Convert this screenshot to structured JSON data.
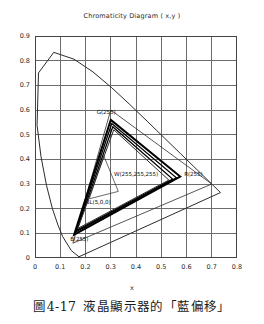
{
  "chart_title": "Chromaticity Diagram ( x,y )",
  "axes": {
    "xlabel": "x",
    "ylabel": "",
    "xlim": [
      0,
      0.8
    ],
    "ylim": [
      0,
      0.9
    ],
    "xticks": [
      "0",
      "0.1",
      "0.2",
      "0.3",
      "0.4",
      "0.5",
      "0.6",
      "0.7",
      "0.8"
    ],
    "yticks": [
      "0",
      "0.1",
      "0.2",
      "0.3",
      "0.4",
      "0.5",
      "0.6",
      "0.7",
      "0.8",
      "0.9"
    ],
    "grid": true
  },
  "caption": {
    "figure_number": "圖4-17",
    "text": "液晶顯示器的「藍偏移」"
  },
  "point_labels": {
    "green": "G(255)",
    "white": "W(255,255,255)",
    "black": "BL(5,0,0)",
    "red": "R(255)",
    "blue": "B(255)"
  },
  "colors": {
    "axis": "#444444",
    "grid": "#6b6b6b",
    "locus": "#2b2b2b",
    "gamut_outer": "#2b2b2b",
    "gamut_shift": "#000000",
    "inner_triangle": "#2b2b2b",
    "text": "#1a1a1a"
  },
  "chart_data": {
    "type": "scatter",
    "title": "Chromaticity Diagram ( x,y )",
    "xlabel": "x",
    "ylabel": "y",
    "xlim": [
      0,
      0.8
    ],
    "ylim": [
      0,
      0.9
    ],
    "grid": true,
    "legend": "none",
    "annotations": [
      {
        "label": "G(255)",
        "x": 0.3,
        "y": 0.565
      },
      {
        "label": "W(255,255,255)",
        "x": 0.305,
        "y": 0.335
      },
      {
        "label": "BL(5,0,0)",
        "x": 0.225,
        "y": 0.235
      },
      {
        "label": "R(255)",
        "x": 0.575,
        "y": 0.335
      },
      {
        "label": "B(255)",
        "x": 0.155,
        "y": 0.095
      }
    ],
    "series": [
      {
        "name": "Spectral locus (CIE 1931)",
        "type": "line",
        "closed": true,
        "points": [
          [
            0.1741,
            0.005
          ],
          [
            0.144,
            0.0297
          ],
          [
            0.1096,
            0.0868
          ],
          [
            0.0913,
            0.1327
          ],
          [
            0.0687,
            0.2007
          ],
          [
            0.0454,
            0.295
          ],
          [
            0.0235,
            0.4127
          ],
          [
            0.0082,
            0.5384
          ],
          [
            0.0139,
            0.7502
          ],
          [
            0.0743,
            0.8338
          ],
          [
            0.1547,
            0.8059
          ],
          [
            0.2296,
            0.7543
          ],
          [
            0.3016,
            0.6923
          ],
          [
            0.3731,
            0.6245
          ],
          [
            0.4441,
            0.5547
          ],
          [
            0.5125,
            0.4866
          ],
          [
            0.5752,
            0.4242
          ],
          [
            0.627,
            0.3725
          ],
          [
            0.6658,
            0.334
          ],
          [
            0.6915,
            0.3083
          ],
          [
            0.7079,
            0.292
          ],
          [
            0.7347,
            0.2653
          ],
          [
            0.1741,
            0.005
          ]
        ]
      },
      {
        "name": "Reference wide gamut triangle",
        "type": "polygon",
        "linewidth": 0.8,
        "points": [
          [
            0.3,
            0.6
          ],
          [
            0.7,
            0.3
          ],
          [
            0.15,
            0.06
          ]
        ]
      },
      {
        "name": "Display gamut - primary (255 drive)",
        "type": "polygon",
        "linewidth": 2.0,
        "points": [
          [
            0.3,
            0.56
          ],
          [
            0.575,
            0.33
          ],
          [
            0.155,
            0.095
          ]
        ]
      },
      {
        "name": "Display gamut - blue shifted 1",
        "type": "polygon",
        "linewidth": 1.3,
        "points": [
          [
            0.304,
            0.545
          ],
          [
            0.56,
            0.325
          ],
          [
            0.16,
            0.105
          ]
        ]
      },
      {
        "name": "Display gamut - blue shifted 2",
        "type": "polygon",
        "linewidth": 1.3,
        "points": [
          [
            0.308,
            0.532
          ],
          [
            0.545,
            0.32
          ],
          [
            0.165,
            0.112
          ]
        ]
      },
      {
        "name": "Display gamut - blue shifted 3",
        "type": "polygon",
        "linewidth": 1.0,
        "points": [
          [
            0.312,
            0.52
          ],
          [
            0.53,
            0.316
          ],
          [
            0.17,
            0.12
          ]
        ]
      },
      {
        "name": "Low-level gamut (BL)",
        "type": "polygon",
        "linewidth": 0.7,
        "points": [
          [
            0.272,
            0.415
          ],
          [
            0.33,
            0.27
          ],
          [
            0.215,
            0.24
          ]
        ]
      }
    ]
  }
}
